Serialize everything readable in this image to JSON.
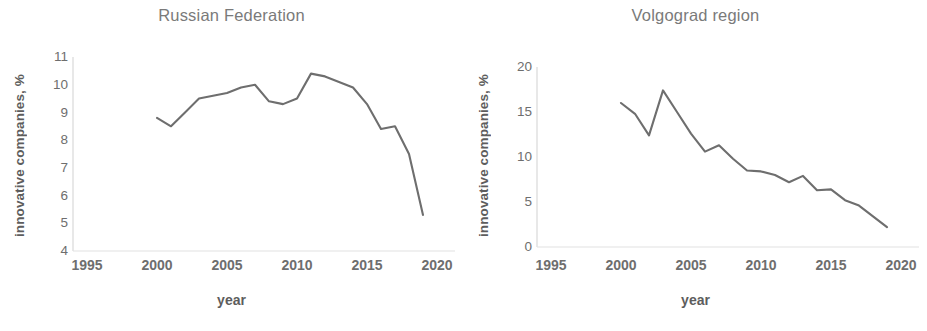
{
  "figure": {
    "background_color": "#ffffff",
    "line_color": "#6e6e6e",
    "text_color": "#6e6e6e",
    "axis_color": "#d9d9d9"
  },
  "panels": [
    {
      "id": "russian-federation",
      "title": "Russian Federation",
      "ylabel": "innovative companies, %",
      "xlabel": "year",
      "yticks": [
        "11",
        "10",
        "9",
        "8",
        "7",
        "6",
        "5",
        "4"
      ],
      "xticks": [
        "1995",
        "2000",
        "2005",
        "2010",
        "2015",
        "2020"
      ]
    },
    {
      "id": "volgograd-region",
      "title": "Volgograd region",
      "ylabel": "innovative companies, %",
      "xlabel": "year",
      "yticks": [
        "20",
        "15",
        "10",
        "5",
        "0"
      ],
      "xticks": [
        "1995",
        "2000",
        "2005",
        "2010",
        "2015",
        "2020"
      ]
    }
  ],
  "chart_data": [
    {
      "type": "line",
      "title": "Russian Federation",
      "xlabel": "year",
      "ylabel": "innovative companies, %",
      "xlim": [
        1995,
        2020
      ],
      "ylim": [
        4,
        11
      ],
      "xticks": [
        1995,
        2000,
        2005,
        2010,
        2015,
        2020
      ],
      "yticks": [
        4,
        5,
        6,
        7,
        8,
        9,
        10,
        11
      ],
      "grid": false,
      "legend": "none",
      "x": [
        2000,
        2001,
        2002,
        2003,
        2004,
        2005,
        2006,
        2007,
        2008,
        2009,
        2010,
        2011,
        2012,
        2013,
        2014,
        2015,
        2016,
        2017,
        2018,
        2019
      ],
      "values": [
        8.8,
        8.5,
        9.0,
        9.5,
        9.6,
        9.7,
        9.9,
        10.0,
        9.4,
        9.3,
        9.5,
        10.4,
        10.3,
        10.1,
        9.9,
        9.3,
        8.4,
        8.5,
        7.5,
        5.3
      ],
      "series": [
        {
          "name": "innovative companies",
          "values": [
            8.8,
            8.5,
            9.0,
            9.5,
            9.6,
            9.7,
            9.9,
            10.0,
            9.4,
            9.3,
            9.5,
            10.4,
            10.3,
            10.1,
            9.9,
            9.3,
            8.4,
            8.5,
            7.5,
            5.3
          ]
        }
      ]
    },
    {
      "type": "line",
      "title": "Volgograd region",
      "xlabel": "year",
      "ylabel": "innovative companies, %",
      "xlim": [
        1995,
        2020
      ],
      "ylim": [
        0,
        20
      ],
      "xticks": [
        1995,
        2000,
        2005,
        2010,
        2015,
        2020
      ],
      "yticks": [
        0,
        5,
        10,
        15,
        20
      ],
      "grid": false,
      "legend": "none",
      "x": [
        2000,
        2001,
        2002,
        2003,
        2004,
        2005,
        2006,
        2007,
        2008,
        2009,
        2010,
        2011,
        2012,
        2013,
        2014,
        2015,
        2016,
        2017,
        2018,
        2019
      ],
      "values": [
        16.0,
        14.8,
        12.4,
        17.4,
        15.0,
        12.6,
        10.6,
        11.3,
        9.8,
        8.5,
        8.4,
        8.0,
        7.2,
        7.9,
        6.3,
        6.4,
        5.2,
        4.6,
        3.4,
        2.2
      ],
      "series": [
        {
          "name": "innovative companies",
          "values": [
            16.0,
            14.8,
            12.4,
            17.4,
            15.0,
            12.6,
            10.6,
            11.3,
            9.8,
            8.5,
            8.4,
            8.0,
            7.2,
            7.9,
            6.3,
            6.4,
            5.2,
            4.6,
            3.4,
            2.2
          ]
        }
      ]
    }
  ]
}
